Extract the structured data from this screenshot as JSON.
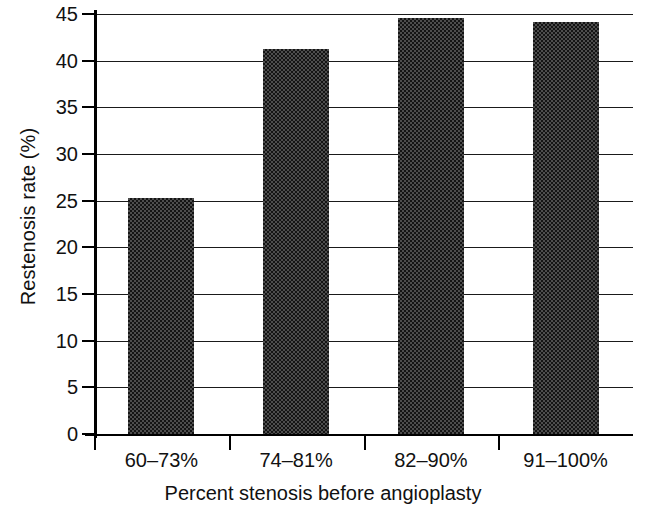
{
  "chart_data": {
    "type": "bar",
    "title": "",
    "subtitle": "",
    "xlabel": "Percent stenosis before angioplasty",
    "ylabel": "Restenosis rate (%)",
    "categories": [
      "60–73%",
      "74–81%",
      "82–90%",
      "91–100%"
    ],
    "values": [
      25.3,
      41.2,
      44.6,
      44.1
    ],
    "series": [
      {
        "name": "Restenosis rate",
        "values": [
          25.3,
          41.2,
          44.6,
          44.1
        ]
      }
    ],
    "ylim": [
      0,
      45
    ],
    "yticks": [
      0,
      5,
      10,
      15,
      20,
      25,
      30,
      35,
      40,
      45
    ],
    "ytick_labels": [
      "0",
      "5",
      "10",
      "15",
      "20",
      "25",
      "30",
      "35",
      "40",
      "45"
    ],
    "xtick_labels": [
      "60–73%",
      "74–81%",
      "82–90%",
      "91–100%"
    ],
    "grid": true,
    "grid_axis": "y",
    "legend": false,
    "legend_position": "none",
    "bar_color": "#4d4d4d",
    "bar_pattern": "checkerboard-dither",
    "axis_color": "#000000",
    "background_color": "#ffffff",
    "annotations": []
  },
  "axis": {
    "y_title": "Restenosis rate (%)",
    "x_title": "Percent stenosis before angioplasty"
  }
}
